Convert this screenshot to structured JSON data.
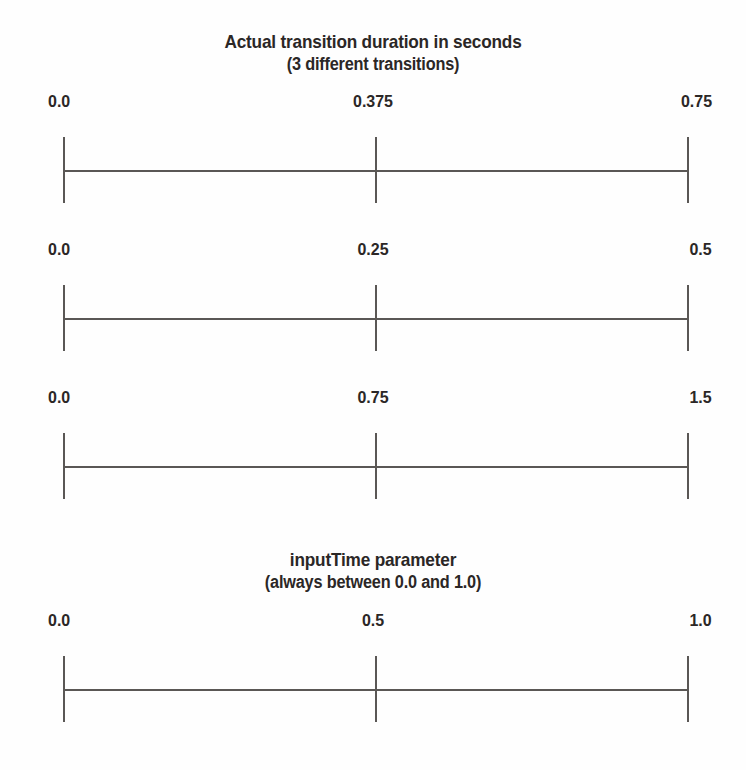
{
  "figure": {
    "background_color": "#fefefe",
    "line_color": "#5a5755",
    "text_color": "#2b2726"
  },
  "captions": {
    "top": {
      "line1": "Actual transition duration in seconds",
      "line2": "(3 different transitions)"
    },
    "bottom": {
      "line1": "inputTime parameter",
      "line2": "(always between 0.0 and 1.0)"
    }
  },
  "axes": [
    {
      "name": "duration-axis-0-75",
      "start_label": "0.0",
      "middle_label": "0.375",
      "end_label": "0.75"
    },
    {
      "name": "duration-axis-0-5",
      "start_label": "0.0",
      "middle_label": "0.25",
      "end_label": "0.5"
    },
    {
      "name": "duration-axis-1-5",
      "start_label": "0.0",
      "middle_label": "0.75",
      "end_label": "1.5"
    },
    {
      "name": "inputtime-axis",
      "start_label": "0.0",
      "middle_label": "0.5",
      "end_label": "1.0"
    }
  ],
  "chart_data": {
    "type": "line",
    "title": "Actual transition duration in seconds (3 different transitions)",
    "subtitle": "inputTime parameter (always between 0.0 and 1.0)",
    "xlabel": "",
    "ylabel": "",
    "grid": false,
    "legend": "none",
    "series": [
      {
        "name": "Actual transition duration in seconds (transition 1)",
        "axis_range": [
          0.0,
          0.75
        ],
        "ticks": [
          0.0,
          0.375,
          0.75
        ],
        "tick_labels": [
          "0.0",
          "0.375",
          "0.75"
        ]
      },
      {
        "name": "Actual transition duration in seconds (transition 2)",
        "axis_range": [
          0.0,
          0.5
        ],
        "ticks": [
          0.0,
          0.25,
          0.5
        ],
        "tick_labels": [
          "0.0",
          "0.25",
          "0.5"
        ]
      },
      {
        "name": "Actual transition duration in seconds (transition 3)",
        "axis_range": [
          0.0,
          1.5
        ],
        "ticks": [
          0.0,
          0.75,
          1.5
        ],
        "tick_labels": [
          "0.0",
          "0.75",
          "1.5"
        ]
      },
      {
        "name": "inputTime parameter",
        "axis_range": [
          0.0,
          1.0
        ],
        "ticks": [
          0.0,
          0.5,
          1.0
        ],
        "tick_labels": [
          "0.0",
          "0.5",
          "1.0"
        ]
      }
    ]
  }
}
